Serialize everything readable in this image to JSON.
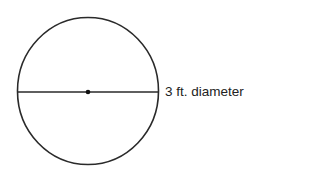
{
  "diagram": {
    "shape": "circle",
    "label": "3 ft. diameter",
    "colors": {
      "stroke": "#2a2a2a",
      "text": "#222222",
      "background": "#ffffff"
    },
    "geometry": {
      "center": [
        88,
        91
      ],
      "rx": 70.5,
      "ry": 73.5,
      "diameter_line_y": 92
    }
  }
}
